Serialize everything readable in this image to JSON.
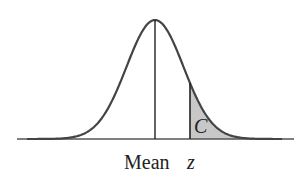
{
  "figure": {
    "type": "normal-distribution-diagram",
    "labels": {
      "mean": "Mean",
      "z": "z",
      "area": "C"
    },
    "colors": {
      "curve": "#444444",
      "shade": "#c8c8c8",
      "axis": "#555555",
      "text": "#222222"
    },
    "geometry": {
      "baseline_y": 139,
      "axis_x": [
        17,
        294
      ],
      "mean_x": 155,
      "peak_y": 20,
      "sigma_px": 28.5,
      "z_x": 190
    }
  }
}
